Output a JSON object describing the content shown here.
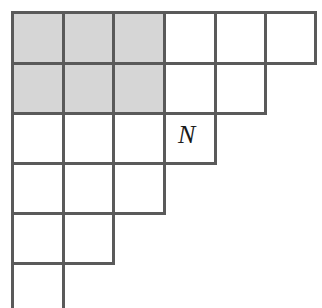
{
  "figure": {
    "type": "young-diagram",
    "origin": {
      "x": 11,
      "y": 11
    },
    "cell_size": 50.5,
    "rows": 6,
    "columns": 6,
    "row_lengths": [
      6,
      5,
      4,
      3,
      2,
      1
    ],
    "bottom_row_clipped": true,
    "colors": {
      "stroke": "#5a5a5a",
      "shaded_fill": "#d6d6d6",
      "empty_fill": "#ffffff",
      "background": "#ffffff",
      "label_color": "#1a1a1a"
    },
    "stroke_width": 3,
    "shaded_block": {
      "row_start": 1,
      "row_end": 2,
      "column_start": 1,
      "column_end": 3,
      "cells": [
        {
          "row": 1,
          "col": 1
        },
        {
          "row": 1,
          "col": 2
        },
        {
          "row": 1,
          "col": 3
        },
        {
          "row": 2,
          "col": 1
        },
        {
          "row": 2,
          "col": 2
        },
        {
          "row": 2,
          "col": 3
        }
      ]
    },
    "labels": [
      {
        "text": "N",
        "row": 3,
        "col": 4,
        "style": "italic",
        "font_size": 26
      }
    ]
  }
}
